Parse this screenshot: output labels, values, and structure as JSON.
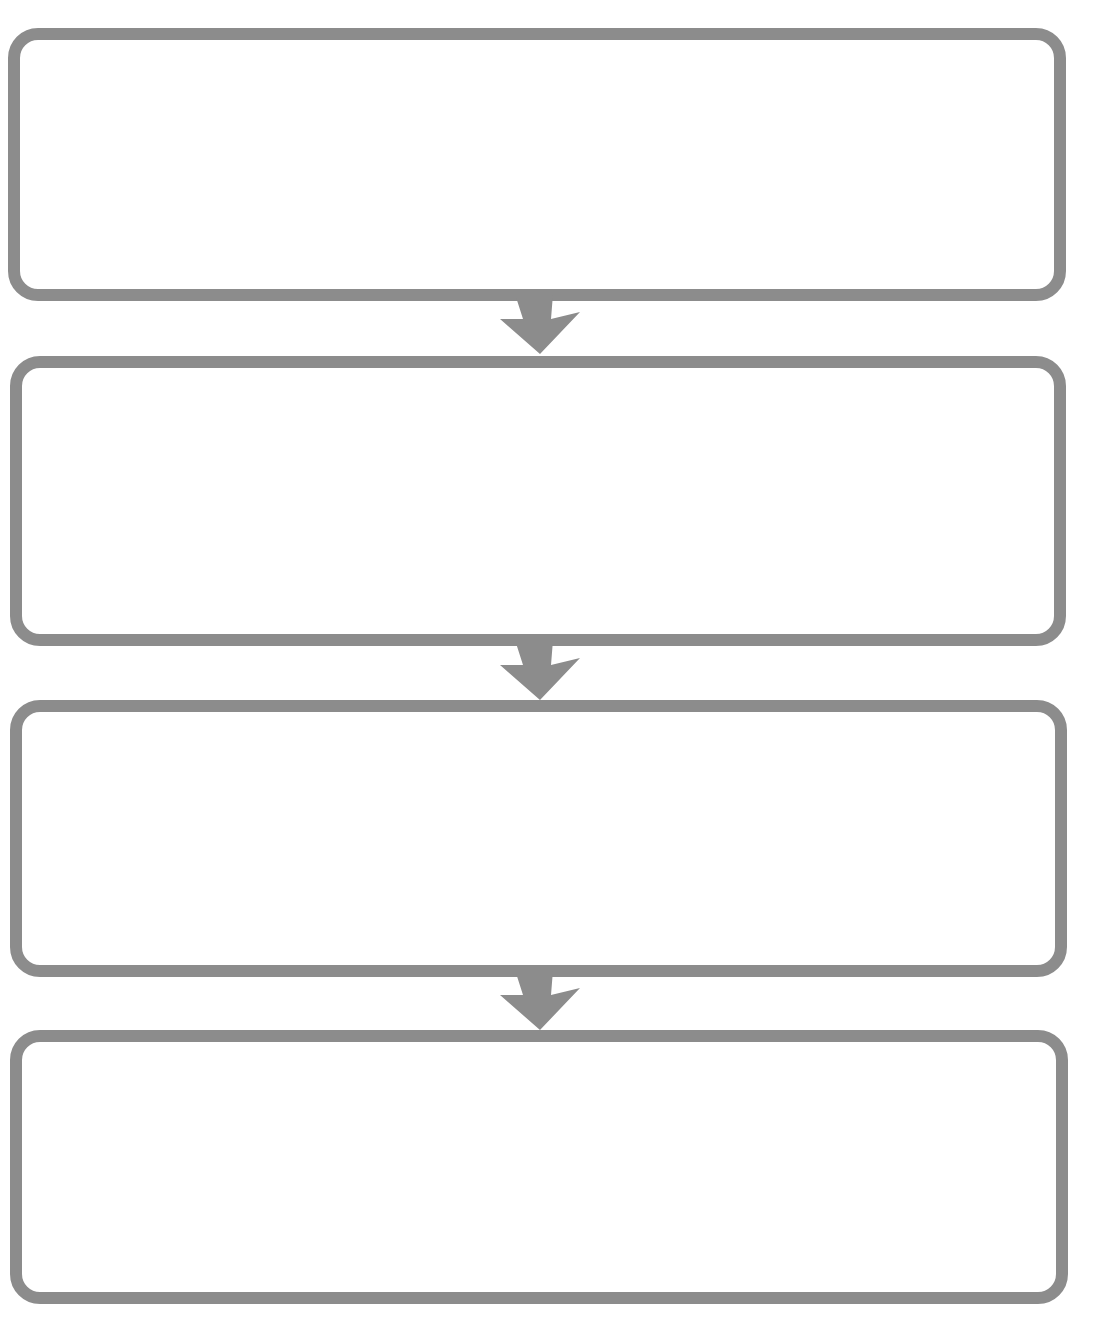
{
  "diagram": {
    "type": "vertical-flowchart",
    "stroke_color": "#8c8c8c",
    "fill_color": "#ffffff",
    "boxes": [
      {
        "label": ""
      },
      {
        "label": ""
      },
      {
        "label": ""
      },
      {
        "label": ""
      }
    ],
    "connectors": [
      {
        "icon": "arrow-down-icon",
        "from": 0,
        "to": 1
      },
      {
        "icon": "arrow-down-icon",
        "from": 1,
        "to": 2
      },
      {
        "icon": "arrow-down-icon",
        "from": 2,
        "to": 3
      }
    ]
  }
}
